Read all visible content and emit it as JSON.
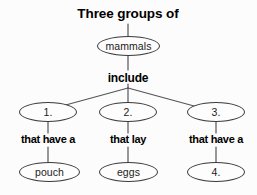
{
  "diagram": {
    "type": "concept-map",
    "title": "Three groups of",
    "root": {
      "id": "mammals",
      "text": "mammals",
      "shape": "ellipse"
    },
    "root_link_label": "include",
    "branches": [
      {
        "node": "1.",
        "link_label": "that have a",
        "child": "pouch"
      },
      {
        "node": "2.",
        "link_label": "that lay",
        "child": "eggs"
      },
      {
        "node": "3.",
        "link_label": "that have a",
        "child": "4."
      }
    ],
    "colors": {
      "background": "#fcfcfc",
      "stroke": "#3a3a3a",
      "text": "#000000",
      "node_text": "#1b1b1b"
    }
  }
}
